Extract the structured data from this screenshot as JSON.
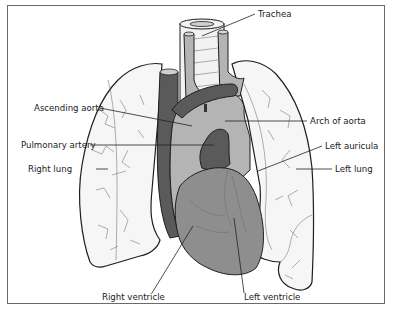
{
  "diagram": {
    "labels": {
      "trachea": "Trachea",
      "ascending_aorta": "Ascending aorta",
      "arch_of_aorta": "Arch of aorta",
      "pulmonary_artery": "Pulmonary artery",
      "left_auricula": "Left auricula",
      "right_lung": "Right lung",
      "left_lung": "Left lung",
      "right_ventricle": "Right ventricle",
      "left_ventricle": "Left ventricle"
    },
    "colors": {
      "frame_border": "#6a6a6a",
      "lung_fill": "#f6f6f6",
      "dark_vessel": "#5a5a5a",
      "ventricle": "#8e8e8e",
      "aorta_light": "#b4b4b4",
      "outline": "#1e1e1e"
    }
  }
}
